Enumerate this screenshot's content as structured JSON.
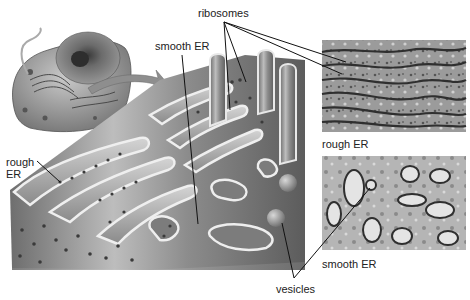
{
  "figure": {
    "illustration": {
      "cell_inset": "cell-cutaway-illustration",
      "main": "er-3d-cutaway-illustration"
    },
    "micrographs": [
      {
        "id": "rough",
        "caption": "rough ER"
      },
      {
        "id": "smooth",
        "caption": "smooth ER"
      }
    ],
    "labels": {
      "ribosomes": "ribosomes",
      "smooth_er": "smooth ER",
      "rough_er_line1": "rough",
      "rough_er_line2": "ER",
      "vesicles": "vesicles"
    },
    "colors": {
      "background": "#ffffff",
      "label_text": "#222222",
      "leader_line": "#111111",
      "membrane_light": "#e6e6e6",
      "membrane_mid": "#9a9a9a",
      "membrane_dark": "#5a5a5a",
      "ribosome_dot": "#3a3a3a"
    }
  }
}
